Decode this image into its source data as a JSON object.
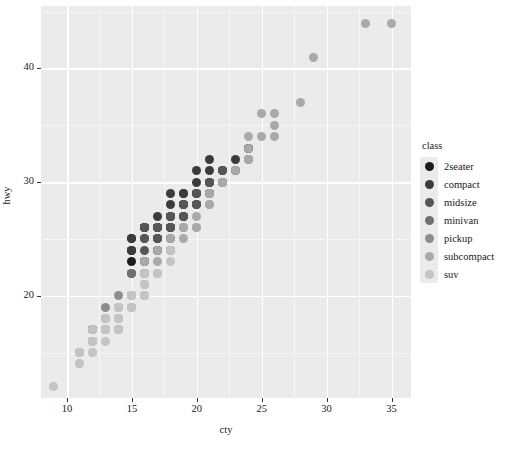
{
  "chart_data": {
    "type": "scatter",
    "title": "",
    "xlabel": "cty",
    "ylabel": "hwy",
    "xlim": [
      8,
      36.5
    ],
    "ylim": [
      11,
      45.5
    ],
    "xticks": [
      10,
      15,
      20,
      25,
      30,
      35
    ],
    "yticks": [
      20,
      30,
      40
    ],
    "grid": true,
    "legend_position": "right",
    "legend_title": "class",
    "legend_entries": [
      {
        "name": "2seater",
        "color": "#1c1c1c"
      },
      {
        "name": "compact",
        "color": "#3b3b3b"
      },
      {
        "name": "midsize",
        "color": "#565656"
      },
      {
        "name": "minivan",
        "color": "#707070"
      },
      {
        "name": "pickup",
        "color": "#8d8d8d"
      },
      {
        "name": "subcompact",
        "color": "#a9a9a9"
      },
      {
        "name": "suv",
        "color": "#c4c4c4"
      }
    ],
    "series": [
      {
        "name": "2seater",
        "color": "#1c1c1c",
        "points": [
          [
            16,
            26
          ],
          [
            15,
            25
          ],
          [
            16,
            26
          ],
          [
            15,
            24
          ],
          [
            15,
            23
          ]
        ]
      },
      {
        "name": "compact",
        "color": "#3b3b3b",
        "points": [
          [
            18,
            29
          ],
          [
            21,
            29
          ],
          [
            20,
            31
          ],
          [
            21,
            30
          ],
          [
            16,
            26
          ],
          [
            18,
            26
          ],
          [
            18,
            27
          ],
          [
            16,
            26
          ],
          [
            20,
            28
          ],
          [
            19,
            27
          ],
          [
            20,
            30
          ],
          [
            15,
            25
          ],
          [
            17,
            26
          ],
          [
            17,
            25
          ],
          [
            15,
            24
          ],
          [
            17,
            25
          ],
          [
            16,
            23
          ],
          [
            21,
            32
          ],
          [
            19,
            29
          ],
          [
            23,
            31
          ],
          [
            23,
            32
          ],
          [
            22,
            31
          ],
          [
            24,
            33
          ],
          [
            19,
            28
          ],
          [
            22,
            31
          ],
          [
            24,
            33
          ],
          [
            18,
            27
          ],
          [
            17,
            26
          ],
          [
            21,
            30
          ],
          [
            19,
            29
          ],
          [
            22,
            30
          ],
          [
            24,
            32
          ],
          [
            18,
            27
          ],
          [
            20,
            29
          ],
          [
            17,
            26
          ],
          [
            21,
            31
          ],
          [
            19,
            28
          ],
          [
            22,
            30
          ],
          [
            15,
            24
          ],
          [
            18,
            28
          ],
          [
            17,
            27
          ],
          [
            20,
            29
          ],
          [
            21,
            30
          ],
          [
            16,
            26
          ],
          [
            19,
            28
          ],
          [
            17,
            26
          ],
          [
            18,
            27
          ]
        ]
      },
      {
        "name": "midsize",
        "color": "#565656",
        "points": [
          [
            18,
            26
          ],
          [
            18,
            27
          ],
          [
            16,
            26
          ],
          [
            18,
            25
          ],
          [
            16,
            24
          ],
          [
            18,
            27
          ],
          [
            17,
            26
          ],
          [
            19,
            27
          ],
          [
            21,
            29
          ],
          [
            16,
            26
          ],
          [
            18,
            26
          ],
          [
            18,
            27
          ],
          [
            19,
            28
          ],
          [
            17,
            26
          ],
          [
            21,
            29
          ],
          [
            16,
            25
          ],
          [
            18,
            26
          ],
          [
            20,
            28
          ],
          [
            19,
            28
          ],
          [
            18,
            26
          ],
          [
            17,
            26
          ],
          [
            19,
            27
          ],
          [
            21,
            30
          ],
          [
            18,
            27
          ],
          [
            20,
            29
          ],
          [
            17,
            25
          ],
          [
            18,
            27
          ],
          [
            19,
            28
          ],
          [
            21,
            29
          ],
          [
            20,
            28
          ],
          [
            16,
            25
          ],
          [
            18,
            26
          ],
          [
            19,
            27
          ],
          [
            20,
            29
          ],
          [
            18,
            26
          ],
          [
            17,
            26
          ],
          [
            19,
            28
          ],
          [
            21,
            30
          ],
          [
            22,
            31
          ],
          [
            20,
            28
          ]
        ]
      },
      {
        "name": "minivan",
        "color": "#707070",
        "points": [
          [
            18,
            24
          ],
          [
            17,
            24
          ],
          [
            17,
            24
          ],
          [
            16,
            22
          ],
          [
            15,
            22
          ],
          [
            16,
            23
          ],
          [
            16,
            23
          ],
          [
            15,
            22
          ],
          [
            17,
            24
          ],
          [
            16,
            23
          ],
          [
            15,
            22
          ]
        ]
      },
      {
        "name": "pickup",
        "color": "#8d8d8d",
        "points": [
          [
            14,
            17
          ],
          [
            13,
            17
          ],
          [
            13,
            17
          ],
          [
            14,
            17
          ],
          [
            14,
            19
          ],
          [
            13,
            19
          ],
          [
            15,
            20
          ],
          [
            14,
            20
          ],
          [
            14,
            17
          ],
          [
            13,
            18
          ],
          [
            12,
            17
          ],
          [
            12,
            17
          ],
          [
            14,
            19
          ],
          [
            15,
            20
          ],
          [
            12,
            16
          ],
          [
            11,
            15
          ],
          [
            12,
            17
          ],
          [
            14,
            19
          ],
          [
            16,
            20
          ],
          [
            15,
            20
          ],
          [
            13,
            17
          ],
          [
            14,
            18
          ],
          [
            12,
            16
          ],
          [
            11,
            15
          ],
          [
            15,
            20
          ],
          [
            16,
            22
          ],
          [
            13,
            17
          ],
          [
            12,
            17
          ],
          [
            14,
            18
          ],
          [
            15,
            19
          ],
          [
            16,
            21
          ],
          [
            12,
            16
          ],
          [
            13,
            17
          ]
        ]
      },
      {
        "name": "subcompact",
        "color": "#a9a9a9",
        "points": [
          [
            24,
            33
          ],
          [
            24,
            32
          ],
          [
            26,
            34
          ],
          [
            25,
            36
          ],
          [
            28,
            37
          ],
          [
            24,
            34
          ],
          [
            26,
            36
          ],
          [
            33,
            44
          ],
          [
            35,
            44
          ],
          [
            29,
            41
          ],
          [
            20,
            26
          ],
          [
            21,
            28
          ],
          [
            19,
            26
          ],
          [
            17,
            22
          ],
          [
            18,
            24
          ],
          [
            21,
            29
          ],
          [
            22,
            30
          ],
          [
            19,
            25
          ],
          [
            20,
            26
          ],
          [
            23,
            31
          ],
          [
            24,
            32
          ],
          [
            18,
            24
          ],
          [
            19,
            26
          ],
          [
            22,
            30
          ],
          [
            21,
            28
          ],
          [
            17,
            23
          ],
          [
            18,
            24
          ],
          [
            26,
            35
          ],
          [
            25,
            34
          ],
          [
            20,
            27
          ],
          [
            21,
            29
          ],
          [
            18,
            25
          ],
          [
            19,
            26
          ],
          [
            16,
            23
          ],
          [
            17,
            24
          ]
        ]
      },
      {
        "name": "suv",
        "color": "#c4c4c4",
        "points": [
          [
            14,
            17
          ],
          [
            14,
            17
          ],
          [
            13,
            17
          ],
          [
            13,
            16
          ],
          [
            12,
            15
          ],
          [
            12,
            15
          ],
          [
            11,
            15
          ],
          [
            9,
            12
          ],
          [
            11,
            14
          ],
          [
            12,
            17
          ],
          [
            13,
            17
          ],
          [
            14,
            18
          ],
          [
            14,
            19
          ],
          [
            15,
            20
          ],
          [
            16,
            22
          ],
          [
            14,
            18
          ],
          [
            13,
            17
          ],
          [
            12,
            16
          ],
          [
            15,
            20
          ],
          [
            16,
            21
          ],
          [
            14,
            19
          ],
          [
            13,
            17
          ],
          [
            12,
            16
          ],
          [
            11,
            15
          ],
          [
            17,
            22
          ],
          [
            18,
            24
          ],
          [
            15,
            20
          ],
          [
            14,
            19
          ],
          [
            13,
            18
          ],
          [
            16,
            21
          ],
          [
            17,
            22
          ],
          [
            14,
            18
          ],
          [
            13,
            17
          ],
          [
            15,
            19
          ],
          [
            16,
            20
          ],
          [
            12,
            16
          ],
          [
            11,
            14
          ],
          [
            14,
            18
          ],
          [
            15,
            19
          ],
          [
            17,
            22
          ],
          [
            18,
            23
          ],
          [
            16,
            20
          ],
          [
            13,
            17
          ],
          [
            12,
            16
          ],
          [
            14,
            18
          ]
        ]
      }
    ]
  },
  "axes": {
    "x_title": "cty",
    "y_title": "hwy",
    "x_tick_labels": [
      "10",
      "15",
      "20",
      "25",
      "30",
      "35"
    ],
    "y_tick_labels": [
      "20",
      "30",
      "40"
    ]
  },
  "legend": {
    "title": "class",
    "items": [
      {
        "label": "2seater"
      },
      {
        "label": "compact"
      },
      {
        "label": "midsize"
      },
      {
        "label": "minivan"
      },
      {
        "label": "pickup"
      },
      {
        "label": "subcompact"
      },
      {
        "label": "suv"
      }
    ]
  }
}
